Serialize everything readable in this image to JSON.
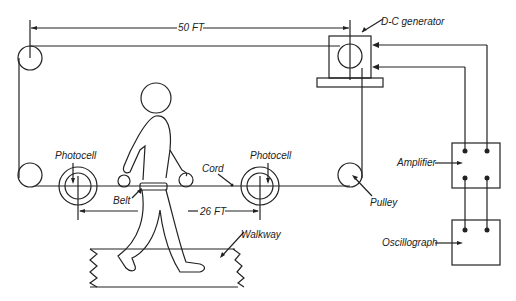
{
  "diagram": {
    "type": "experimental setup schematic",
    "labels": {
      "distance_top": "50 FT",
      "distance_bottom": "26 FT",
      "generator": "D-C generator",
      "photocell_left": "Photocell",
      "photocell_right": "Photocell",
      "cord": "Cord",
      "belt": "Belt",
      "pulley": "Pulley",
      "walkway": "Walkway",
      "amplifier": "Amplifier",
      "oscillograph": "Oscillograph"
    },
    "components": [
      {
        "id": "pulley-top-left",
        "shape": "circle"
      },
      {
        "id": "pulley-bottom-left",
        "shape": "circle"
      },
      {
        "id": "pulley-bottom-right",
        "shape": "circle"
      },
      {
        "id": "generator-pulley",
        "shape": "circle"
      },
      {
        "id": "dc-generator",
        "shape": "box-on-base"
      },
      {
        "id": "photocell-left",
        "shape": "concentric-circles"
      },
      {
        "id": "photocell-right",
        "shape": "concentric-circles"
      },
      {
        "id": "walking-figure",
        "shape": "human-outline"
      },
      {
        "id": "walkway",
        "shape": "platform"
      },
      {
        "id": "amplifier",
        "shape": "box-with-4-terminals"
      },
      {
        "id": "oscillograph",
        "shape": "box-with-2-terminals"
      }
    ],
    "colors": {
      "line": "#222222",
      "background": "#ffffff"
    }
  }
}
